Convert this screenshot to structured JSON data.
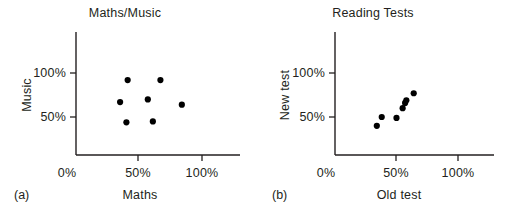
{
  "figure": {
    "background": "#ffffff",
    "ink_color": "#231f20",
    "point_color": "#000000"
  },
  "panels": [
    {
      "id": "a",
      "caption": "(a)",
      "title": "Maths/Music",
      "xlabel": "Maths",
      "ylabel": "Music",
      "x_ticks": [
        "0%",
        "50%",
        "100%"
      ],
      "y_ticks": [
        "50%",
        "100%"
      ]
    },
    {
      "id": "b",
      "caption": "(b)",
      "title": "Reading Tests",
      "xlabel": "Old test",
      "ylabel": "New test",
      "x_ticks": [
        "0%",
        "50%",
        "100%"
      ],
      "y_ticks": [
        "50%",
        "100%"
      ]
    }
  ],
  "chart_data": [
    {
      "type": "scatter",
      "title": "Maths/Music",
      "panel": "(a)",
      "xlabel": "Maths",
      "ylabel": "Music",
      "xlim": [
        0,
        120
      ],
      "ylim": [
        0,
        140
      ],
      "xticks": [
        0,
        50,
        100
      ],
      "xticklabels": [
        "0%",
        "50%",
        "100%"
      ],
      "yticks": [
        50,
        100
      ],
      "yticklabels": [
        "50%",
        "100%"
      ],
      "grid": false,
      "legend": null,
      "marker": "filled-circle",
      "points": [
        {
          "x": 41,
          "y": 92
        },
        {
          "x": 67,
          "y": 92
        },
        {
          "x": 35,
          "y": 67
        },
        {
          "x": 57,
          "y": 70
        },
        {
          "x": 40,
          "y": 44
        },
        {
          "x": 61,
          "y": 45
        },
        {
          "x": 84,
          "y": 64
        }
      ]
    },
    {
      "type": "scatter",
      "title": "Reading Tests",
      "panel": "(b)",
      "xlabel": "Old test",
      "ylabel": "New test",
      "xlim": [
        0,
        120
      ],
      "ylim": [
        0,
        140
      ],
      "xticks": [
        0,
        50,
        100
      ],
      "xticklabels": [
        "0%",
        "50%",
        "100%"
      ],
      "yticks": [
        50,
        100
      ],
      "yticklabels": [
        "50%",
        "100%"
      ],
      "grid": false,
      "legend": null,
      "marker": "filled-circle",
      "points": [
        {
          "x": 34,
          "y": 40
        },
        {
          "x": 38,
          "y": 50
        },
        {
          "x": 50,
          "y": 49
        },
        {
          "x": 55,
          "y": 60
        },
        {
          "x": 57,
          "y": 66
        },
        {
          "x": 58,
          "y": 69
        },
        {
          "x": 64,
          "y": 77
        }
      ]
    }
  ]
}
